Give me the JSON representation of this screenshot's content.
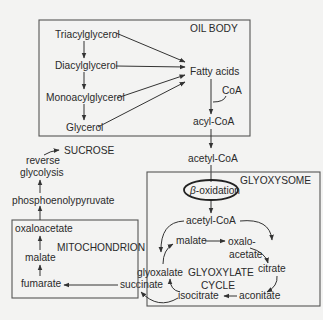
{
  "compartments": {
    "oil_body": "OIL BODY",
    "glyoxysome": "GLYOXYSOME",
    "mitochondrion": "MITOCHONDRION"
  },
  "oil_body_nodes": {
    "triacylglycerol": "Triacylglycerol",
    "diacylglycerol": "Diacylglycerol",
    "monoacylglycerol": "Monoacylglycerol",
    "glycerol": "Glycerol",
    "fatty_acids": "Fatty acids",
    "coa": "CoA",
    "acyl_coa": "acyl-CoA"
  },
  "transit": {
    "acetyl_coa": "acetyl-CoA"
  },
  "glyoxysome_nodes": {
    "beta_symbol": "β",
    "beta_oxidation": "-oxidation",
    "acetyl_coa": "acetyl-CoA",
    "malate": "malate",
    "oxalo": "oxalo-",
    "acetate": "acetate",
    "citrate": "citrate",
    "aconitate": "aconitate",
    "isocitrate": "isocitrate",
    "glyoxalate": "glyoxalate",
    "succinate": "succinate",
    "cycle_line1": "GLYOXYLATE",
    "cycle_line2": "CYCLE"
  },
  "mitochondrion_nodes": {
    "oxaloacetate": "oxaloacetate",
    "malate": "malate",
    "fumarate": "fumarate"
  },
  "cytosol_nodes": {
    "phosphoenolpyruvate": "phosphoenolypyruvate",
    "reverse": "reverse",
    "glycolysis": "glycolysis",
    "sucrose": "SUCROSE"
  },
  "colors": {
    "ink": "#2a2a2a",
    "box_stroke": "#555555",
    "background": "#f3f3f2"
  }
}
